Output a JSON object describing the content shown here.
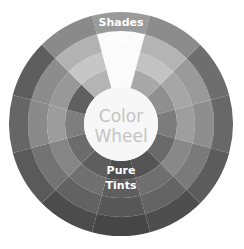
{
  "diagram": {
    "title": "Color Wheel",
    "center": {
      "line1": "Color",
      "line2": "Wheel",
      "fill": "#f7f7f7",
      "text_color": "#c4c4c4"
    },
    "geometry": {
      "cx": 121,
      "cy": 124,
      "r_inner": 37,
      "r_outer": 112,
      "sectors": 12,
      "rings": 4
    },
    "rings": [
      {
        "name": "Pure",
        "label": "Pure",
        "label_position": "bottom",
        "r0": 37,
        "r1": 56
      },
      {
        "name": "Tints",
        "label": "Tints",
        "label_position": "bottom",
        "r0": 56,
        "r1": 74
      },
      {
        "name": "Tones",
        "label": "Tones",
        "label_position": "top",
        "r0": 74,
        "r1": 93
      },
      {
        "name": "Shades",
        "label": "Shades",
        "label_position": "top",
        "r0": 93,
        "r1": 112
      }
    ],
    "highlight": {
      "sector": 0,
      "ring_span": [
        0,
        2
      ],
      "fill": "#fbfbfb"
    },
    "sector_grays": [
      [
        "#d8d8d8",
        "#cfcfcf",
        "#bfbfbf",
        "#9a9a9a"
      ],
      [
        "#a8a8a8",
        "#c2c2c2",
        "#b4b4b4",
        "#8c8c8c"
      ],
      [
        "#8f8f8f",
        "#a6a6a6",
        "#9a9a9a",
        "#6e6e6e"
      ],
      [
        "#7c7c7c",
        "#9e9e9e",
        "#8e8e8e",
        "#686868"
      ],
      [
        "#6a6a6a",
        "#888888",
        "#7a7a7a",
        "#5c5c5c"
      ],
      [
        "#545454",
        "#6f6f6f",
        "#646464",
        "#4e4e4e"
      ],
      [
        "#4e4e4e",
        "#5e5e5e",
        "#575757",
        "#464646"
      ],
      [
        "#5e5e5e",
        "#707070",
        "#626262",
        "#4c4c4c"
      ],
      [
        "#6c6c6c",
        "#858585",
        "#737373",
        "#5a5a5a"
      ],
      [
        "#7e7e7e",
        "#9c9c9c",
        "#8a8a8a",
        "#666666"
      ],
      [
        "#606060",
        "#989898",
        "#8c8c8c",
        "#5e5e5e"
      ],
      [
        "#b4b4b4",
        "#c6c6c6",
        "#b2b2b2",
        "#8a8a8a"
      ]
    ],
    "labels": {
      "shades": "Shades",
      "tones": "Tones",
      "pure": "Pure",
      "tints": "Tints"
    }
  }
}
